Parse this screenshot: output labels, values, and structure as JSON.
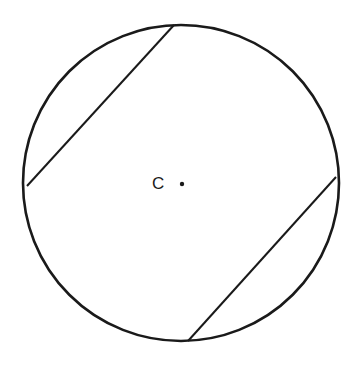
{
  "diagram": {
    "type": "geometry",
    "circle": {
      "cx": 181,
      "cy": 183,
      "r": 158,
      "stroke": "#1a1a1a",
      "stroke_width": 2.6
    },
    "center": {
      "label": "C",
      "dot_x": 182,
      "dot_y": 184,
      "label_x": 152,
      "label_y": 189
    },
    "chords": [
      {
        "name": "upper-left-chord",
        "x1": 174,
        "y1": 25,
        "x2": 27,
        "y2": 186
      },
      {
        "name": "lower-right-chord",
        "x1": 336,
        "y1": 177,
        "x2": 188,
        "y2": 341
      }
    ]
  }
}
